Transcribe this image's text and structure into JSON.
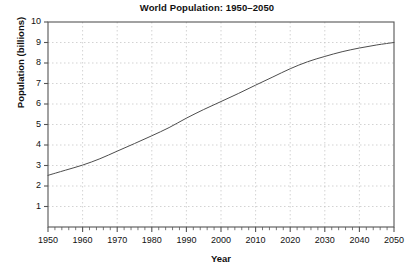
{
  "chart_data": {
    "type": "line",
    "title": "World Population: 1950–2050",
    "xlabel": "Year",
    "ylabel": "Population (billions)",
    "xlim": [
      1950,
      2050
    ],
    "ylim": [
      0,
      10
    ],
    "grid": true,
    "legend": false,
    "line_color": "#4d4d4d",
    "grid_color": "#c8c8c8",
    "axis_color": "#555555",
    "background_color": "#ffffff",
    "x_ticks": [
      1950,
      1960,
      1970,
      1980,
      1990,
      2000,
      2010,
      2020,
      2030,
      2040,
      2050
    ],
    "x_minor_tick_interval": 2,
    "y_ticks": [
      1,
      2,
      3,
      4,
      5,
      6,
      7,
      8,
      9,
      10
    ],
    "x": [
      1950,
      1955,
      1960,
      1965,
      1970,
      1975,
      1980,
      1985,
      1990,
      1995,
      2000,
      2005,
      2010,
      2015,
      2020,
      2025,
      2030,
      2035,
      2040,
      2045,
      2050
    ],
    "values": [
      2.52,
      2.77,
      3.02,
      3.33,
      3.7,
      4.07,
      4.45,
      4.85,
      5.31,
      5.73,
      6.12,
      6.51,
      6.92,
      7.32,
      7.72,
      8.06,
      8.32,
      8.55,
      8.73,
      8.88,
      9.0
    ],
    "series": [
      {
        "name": "World population",
        "values": [
          2.52,
          2.77,
          3.02,
          3.33,
          3.7,
          4.07,
          4.45,
          4.85,
          5.31,
          5.73,
          6.12,
          6.51,
          6.92,
          7.32,
          7.72,
          8.06,
          8.32,
          8.55,
          8.73,
          8.88,
          9.0
        ]
      }
    ],
    "y_tick_labels": [
      "1",
      "2",
      "3",
      "4",
      "5",
      "6",
      "7",
      "8",
      "9",
      "10"
    ],
    "x_tick_labels": [
      "1950",
      "1960",
      "1970",
      "1980",
      "1990",
      "2000",
      "2010",
      "2020",
      "2030",
      "2040",
      "2050"
    ]
  }
}
